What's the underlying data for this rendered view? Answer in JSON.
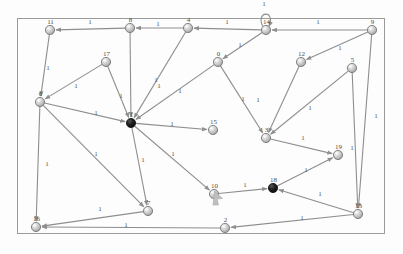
{
  "figure": {
    "kind": "directed-weighted-graph",
    "background_color": "#fdfdfd",
    "border_color": "#9a9a9a",
    "border_rect": {
      "x": 17,
      "y": 18,
      "width": 368,
      "height": 216
    },
    "edge_color": "#8e8e8e",
    "node_fill_light": "#efefef",
    "node_fill_mid": "#b9b9b9",
    "node_stroke": "#6f6f6f",
    "node_highlight_fill": "#1a1a1a",
    "label_color": "#4d4d4d",
    "cursor_color": "#bfbfbf"
  },
  "graph_data": {
    "type": "graph",
    "directed": true,
    "weighted": true,
    "default_edge_weight": "1",
    "node_count": 20,
    "nodes": [
      {
        "id": "11",
        "label": "11",
        "x": 50,
        "y": 30,
        "highlighted": false
      },
      {
        "id": "8",
        "label": "8",
        "x": 130,
        "y": 28,
        "highlighted": false
      },
      {
        "id": "4",
        "label": "4",
        "x": 188,
        "y": 28,
        "highlighted": false
      },
      {
        "id": "14",
        "label": "14",
        "x": 266,
        "y": 30,
        "highlighted": false,
        "self_loop": true
      },
      {
        "id": "9",
        "label": "9",
        "x": 372,
        "y": 30,
        "highlighted": false
      },
      {
        "id": "17",
        "label": "17",
        "x": 106,
        "y": 62,
        "highlighted": false
      },
      {
        "id": "0",
        "label": "0",
        "x": 218,
        "y": 62,
        "highlighted": false
      },
      {
        "id": "12",
        "label": "12",
        "x": 301,
        "y": 62,
        "highlighted": false
      },
      {
        "id": "5",
        "label": "5",
        "x": 352,
        "y": 68,
        "highlighted": false
      },
      {
        "id": "6",
        "label": "6",
        "x": 40,
        "y": 102,
        "highlighted": false
      },
      {
        "id": "1",
        "label": "1",
        "x": 131,
        "y": 123,
        "highlighted": true
      },
      {
        "id": "15",
        "label": "15",
        "x": 213,
        "y": 130,
        "highlighted": false
      },
      {
        "id": "3",
        "label": "3",
        "x": 266,
        "y": 138,
        "highlighted": false
      },
      {
        "id": "19",
        "label": "19",
        "x": 338,
        "y": 155,
        "highlighted": false
      },
      {
        "id": "10",
        "label": "10",
        "x": 214,
        "y": 194,
        "highlighted": false
      },
      {
        "id": "18",
        "label": "18",
        "x": 273,
        "y": 188,
        "highlighted": true
      },
      {
        "id": "7",
        "label": "7",
        "x": 148,
        "y": 211,
        "highlighted": false
      },
      {
        "id": "16",
        "label": "16",
        "x": 36,
        "y": 227,
        "highlighted": false
      },
      {
        "id": "2",
        "label": "2",
        "x": 225,
        "y": 228,
        "highlighted": false
      },
      {
        "id": "13",
        "label": "13",
        "x": 358,
        "y": 214,
        "highlighted": false
      }
    ],
    "edges": [
      {
        "from": "8",
        "to": "11",
        "weight": "1",
        "lx": 90,
        "ly": 24
      },
      {
        "from": "4",
        "to": "8",
        "weight": "1",
        "lx": 158,
        "ly": 26
      },
      {
        "from": "14",
        "to": "4",
        "weight": "1",
        "lx": 227,
        "ly": 24
      },
      {
        "from": "9",
        "to": "14",
        "weight": "1",
        "lx": 318,
        "ly": 24
      },
      {
        "from": "14",
        "to": "14",
        "weight": "1",
        "lx": 264,
        "ly": 6
      },
      {
        "from": "11",
        "to": "6",
        "weight": "1",
        "lx": 48,
        "ly": 70
      },
      {
        "from": "8",
        "to": "1",
        "weight": "1",
        "lx": 156,
        "ly": 82
      },
      {
        "from": "4",
        "to": "1",
        "weight": "1",
        "lx": 159,
        "ly": 88
      },
      {
        "from": "14",
        "to": "0",
        "weight": "1",
        "lx": 240,
        "ly": 47
      },
      {
        "from": "9",
        "to": "12",
        "weight": "1",
        "lx": 340,
        "ly": 50
      },
      {
        "from": "17",
        "to": "6",
        "weight": "1",
        "lx": 76,
        "ly": 88
      },
      {
        "from": "17",
        "to": "1",
        "weight": "1",
        "lx": 121,
        "ly": 98
      },
      {
        "from": "0",
        "to": "1",
        "weight": "1",
        "lx": 180,
        "ly": 93
      },
      {
        "from": "0",
        "to": "3",
        "weight": "1",
        "lx": 243,
        "ly": 101
      },
      {
        "from": "12",
        "to": "3",
        "weight": "1",
        "lx": 258,
        "ly": 102
      },
      {
        "from": "5",
        "to": "3",
        "weight": "1",
        "lx": 310,
        "ly": 110
      },
      {
        "from": "9",
        "to": "13",
        "weight": "1",
        "lx": 376,
        "ly": 118
      },
      {
        "from": "6",
        "to": "1",
        "weight": "1",
        "lx": 96,
        "ly": 115
      },
      {
        "from": "1",
        "to": "15",
        "weight": "1",
        "lx": 172,
        "ly": 126
      },
      {
        "from": "3",
        "to": "19",
        "weight": "1",
        "lx": 303,
        "ly": 140
      },
      {
        "from": "6",
        "to": "16",
        "weight": "1",
        "lx": 47,
        "ly": 166
      },
      {
        "from": "6",
        "to": "7",
        "weight": "1",
        "lx": 96,
        "ly": 156
      },
      {
        "from": "1",
        "to": "7",
        "weight": "1",
        "lx": 143,
        "ly": 162
      },
      {
        "from": "1",
        "to": "10",
        "weight": "1",
        "lx": 173,
        "ly": 156
      },
      {
        "from": "18",
        "to": "19",
        "weight": "1",
        "lx": 306,
        "ly": 172
      },
      {
        "from": "10",
        "to": "18",
        "weight": "1",
        "lx": 245,
        "ly": 187
      },
      {
        "from": "13",
        "to": "18",
        "weight": "1",
        "lx": 320,
        "ly": 196
      },
      {
        "from": "5",
        "to": "13",
        "weight": "1",
        "lx": 352,
        "ly": 150
      },
      {
        "from": "7",
        "to": "16",
        "weight": "1",
        "lx": 100,
        "ly": 211
      },
      {
        "from": "13",
        "to": "2",
        "weight": "1",
        "lx": 302,
        "ly": 220
      },
      {
        "from": "2",
        "to": "16",
        "weight": "1",
        "lx": 126,
        "ly": 227
      }
    ]
  },
  "cursor": {
    "name": "arrow-pointer",
    "x": 213,
    "y": 205
  }
}
